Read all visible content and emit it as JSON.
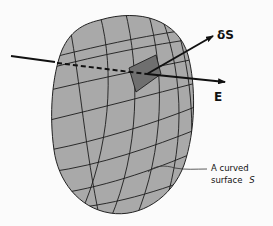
{
  "diagram": {
    "colors": {
      "background": "#fbfbfb",
      "surface_fill": "#a9a9a9",
      "patch_fill": "#6f6f6f",
      "grid_line": "#1c1c1c",
      "arrow": "#111111"
    },
    "labels": {
      "area_vector": "δS",
      "field": "E",
      "annotation_line1": "A curved",
      "annotation_line2": "surface",
      "annotation_symbol": "S"
    },
    "elements": [
      {
        "name": "curved-surface",
        "type": "closed-shape"
      },
      {
        "name": "surface-grid",
        "type": "curvilinear-mesh",
        "rows": 8,
        "cols": 6
      },
      {
        "name": "area-element-patch",
        "type": "shaded-quad"
      },
      {
        "name": "field-line-E",
        "type": "line",
        "segments": [
          "solid-outside",
          "dashed-behind-surface",
          "solid-arrow-out"
        ]
      },
      {
        "name": "normal-vector-dS",
        "type": "arrow"
      }
    ]
  }
}
